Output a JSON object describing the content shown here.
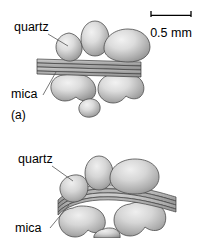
{
  "figure": {
    "type": "schematic-diagram",
    "background_color": "#ffffff",
    "grain_fill_light": "#ededed",
    "grain_fill_dark": "#909090",
    "grain_outline": "#4d4d4d",
    "mica_fill_light": "#c8c8c8",
    "mica_fill_dark": "#8f8f8f",
    "mica_outline": "#3c3c3c",
    "leader_line_color": "#555555",
    "text_color": "#000000"
  },
  "scale_bar": {
    "label": "0.5 mm",
    "tick_style": "downward-end-ticks",
    "bar_color": "#000000"
  },
  "panels": [
    {
      "id": "a",
      "caption": "(a)",
      "mica_state": "straight",
      "labels": [
        {
          "key": "quartz",
          "text": "quartz"
        },
        {
          "key": "mica",
          "text": "mica"
        }
      ],
      "grain_counts": {
        "above_mica": 3,
        "below_mica": 3
      }
    },
    {
      "id": "b",
      "caption": "",
      "mica_state": "buckled",
      "labels": [
        {
          "key": "quartz",
          "text": "quartz"
        },
        {
          "key": "mica",
          "text": "mica"
        }
      ],
      "grain_counts": {
        "above_mica": 3,
        "below_mica": 3
      }
    }
  ]
}
